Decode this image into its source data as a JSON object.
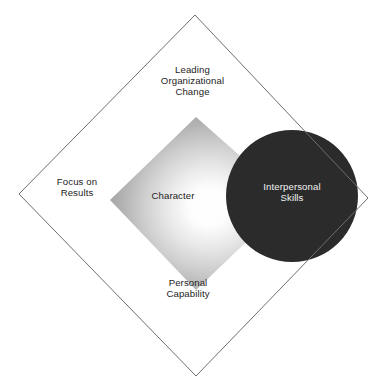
{
  "diagram": {
    "shapes": {
      "outer_diamond": {
        "name": "outer-diamond-outline",
        "stroke_color": "#6e6e6e",
        "fill_color": "none",
        "points": "195,15 368,198 196,376 19,194"
      },
      "inner_diamond": {
        "name": "character-gradient-diamond",
        "gradient_center_color": "#ffffff",
        "gradient_edge_color": "#9a9a9a",
        "points": "196,117 290,200 196,290 110,200"
      },
      "circle": {
        "name": "interpersonal-skills-circle",
        "fill_color": "#2b2b2b",
        "cx": 292,
        "cy": 196,
        "r": 66
      }
    },
    "labels": {
      "top": {
        "name": "leading-organizational-change",
        "lines": [
          "Leading",
          "Organizational",
          "Change"
        ]
      },
      "left": {
        "name": "focus-on-results",
        "lines": [
          "Focus on",
          "Results"
        ]
      },
      "bottom": {
        "name": "personal-capability",
        "lines": [
          "Personal",
          "Capability"
        ]
      },
      "center": {
        "name": "character",
        "lines": [
          "Character"
        ]
      },
      "circle": {
        "name": "interpersonal-skills",
        "lines": [
          "Interpersonal",
          "Skills"
        ]
      }
    }
  }
}
